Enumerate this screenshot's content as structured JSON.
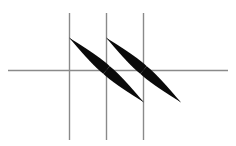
{
  "figure": {
    "title": "",
    "background_color": "#ffffff",
    "width": 236,
    "height": 146,
    "clipped_header_text": "a b c d e f g h i j k l m n o p q r",
    "axis": {
      "line_color": "#8a8a8a",
      "line_width": 1.4,
      "horizontal": {
        "name": "horizontal-axis",
        "y": 70.5,
        "x_start": 8,
        "x_end": 228
      },
      "verticals": [
        {
          "name": "vertical-line-1",
          "x": 69.5,
          "y_start": 13,
          "y_end": 140
        },
        {
          "name": "vertical-line-2",
          "x": 106.5,
          "y_start": 13,
          "y_end": 140
        },
        {
          "name": "vertical-line-3",
          "x": 143.5,
          "y_start": 13,
          "y_end": 140
        }
      ]
    },
    "spindles": {
      "fill_color": "#0a0a0a",
      "shapes": [
        {
          "name": "spindle-upper-left",
          "tip_x": 69.5,
          "tip_y": 38,
          "base_x": 106.5,
          "base_y": 70,
          "max_half_width": 5.0
        },
        {
          "name": "spindle-lower-left",
          "tip_x": 143.5,
          "tip_y": 102,
          "base_x": 106.5,
          "base_y": 70,
          "max_half_width": 5.0
        },
        {
          "name": "spindle-upper-right",
          "tip_x": 106.5,
          "tip_y": 38,
          "base_x": 143.5,
          "base_y": 70,
          "max_half_width": 5.0
        },
        {
          "name": "spindle-lower-right",
          "tip_x": 180.5,
          "tip_y": 102,
          "base_x": 143.5,
          "base_y": 70,
          "max_half_width": 5.0
        }
      ]
    },
    "hairlines": [
      {
        "name": "hairline-upper-left",
        "x1": 69.5,
        "y1": 38,
        "x2": 106.5,
        "y2": 70
      },
      {
        "name": "hairline-lower-left",
        "x1": 106.5,
        "y1": 70,
        "x2": 143.5,
        "y2": 102
      },
      {
        "name": "hairline-upper-right",
        "x1": 106.5,
        "y1": 38,
        "x2": 143.5,
        "y2": 70
      },
      {
        "name": "hairline-lower-right",
        "x1": 143.5,
        "y1": 70,
        "x2": 180.5,
        "y2": 102
      }
    ]
  },
  "chart_data": {
    "type": "scatter",
    "title": "",
    "subtitle": "",
    "xlabel": "",
    "ylabel": "",
    "grid": true,
    "legend": null,
    "gridlines": {
      "horizontal": [
        70.5
      ],
      "vertical": [
        69.5,
        106.5,
        143.5
      ]
    },
    "x": [
      69.5,
      106.5,
      143.5,
      180.5
    ],
    "y": [
      38,
      70,
      102,
      102
    ],
    "series": [
      {
        "name": "spindle-diagonal-a",
        "points": [
          {
            "x": 69.5,
            "y": 38,
            "width": 0
          },
          {
            "x": 106.5,
            "y": 70,
            "width": 10
          },
          {
            "x": 143.5,
            "y": 102,
            "width": 0
          }
        ]
      },
      {
        "name": "spindle-diagonal-b",
        "points": [
          {
            "x": 106.5,
            "y": 38,
            "width": 0
          },
          {
            "x": 143.5,
            "y": 70,
            "width": 10
          },
          {
            "x": 180.5,
            "y": 102,
            "width": 0
          }
        ]
      }
    ],
    "xlim": [
      0,
      236
    ],
    "ylim": [
      146,
      0
    ]
  }
}
